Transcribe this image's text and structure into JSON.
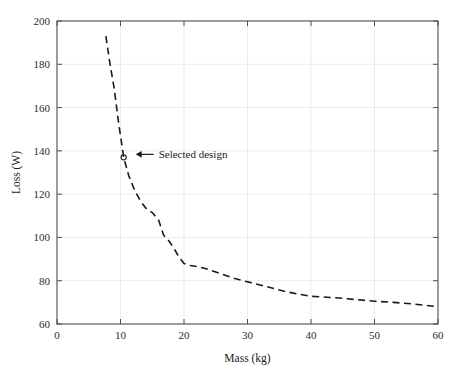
{
  "chart_data": {
    "type": "line",
    "title": "",
    "xlabel": "Mass (kg)",
    "ylabel": "Loss (W)",
    "xlim": [
      0,
      60
    ],
    "ylim": [
      60,
      200
    ],
    "xticks": [
      0,
      10,
      20,
      30,
      40,
      50,
      60
    ],
    "yticks": [
      60,
      80,
      100,
      120,
      140,
      160,
      180,
      200
    ],
    "xtick_labels": [
      "0",
      "10",
      "20",
      "30",
      "40",
      "50",
      "60"
    ],
    "ytick_labels": [
      "60",
      "80",
      "100",
      "120",
      "140",
      "160",
      "180",
      "200"
    ],
    "grid": true,
    "legend": "none",
    "line_style": "dashed",
    "line_color": "#1a1a1a",
    "grid_color": "#ebebeb",
    "axis_color": "#4d4d4d",
    "series": [
      {
        "name": "Pareto front",
        "x": [
          7.7,
          8.3,
          9.0,
          9.7,
          10.5,
          11.3,
          12.2,
          13.1,
          14.0,
          15.0,
          16.0,
          16.8,
          17.6,
          18.4,
          19.2,
          20.0,
          21.0,
          22.2,
          23.5,
          25.0,
          26.5,
          28.0,
          30.0,
          32.0,
          34.0,
          36.0,
          38.0,
          40.0,
          42.0,
          44.5,
          47.0,
          50.0,
          53.0,
          56.0,
          60.0
        ],
        "y": [
          193.0,
          181.0,
          169.0,
          153.0,
          137.0,
          128.5,
          122.0,
          117.0,
          113.5,
          111.5,
          108.0,
          101.0,
          98.5,
          95.0,
          91.0,
          88.0,
          87.0,
          86.5,
          85.5,
          84.0,
          82.5,
          81.0,
          79.5,
          78.0,
          76.5,
          75.0,
          73.8,
          72.8,
          72.5,
          72.0,
          71.3,
          70.5,
          70.0,
          69.3,
          68.0
        ]
      }
    ],
    "annotations": [
      {
        "text": "Selected design",
        "marker_x": 10.5,
        "marker_y": 137.0,
        "marker_shape": "circle",
        "arrow": "left-pointing"
      }
    ]
  }
}
